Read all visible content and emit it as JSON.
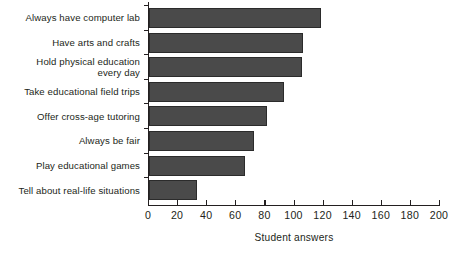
{
  "chart_data": {
    "type": "bar",
    "orientation": "horizontal",
    "title": "",
    "xlabel": "Student answers",
    "ylabel": "",
    "xlim": [
      0,
      200
    ],
    "xticks": [
      0,
      20,
      40,
      60,
      80,
      100,
      120,
      140,
      160,
      180,
      200
    ],
    "grid": false,
    "legend": null,
    "bar_color": "#4a4a4a",
    "axis_color": "#231f20",
    "categories": [
      "Always have computer lab",
      "Have arts and crafts",
      "Hold physical education\nevery day",
      "Take educational field trips",
      "Offer cross-age tutoring",
      "Always be fair",
      "Play educational games",
      "Tell about real-life situations"
    ],
    "values": [
      118,
      106,
      105,
      93,
      81,
      72,
      66,
      33
    ]
  }
}
